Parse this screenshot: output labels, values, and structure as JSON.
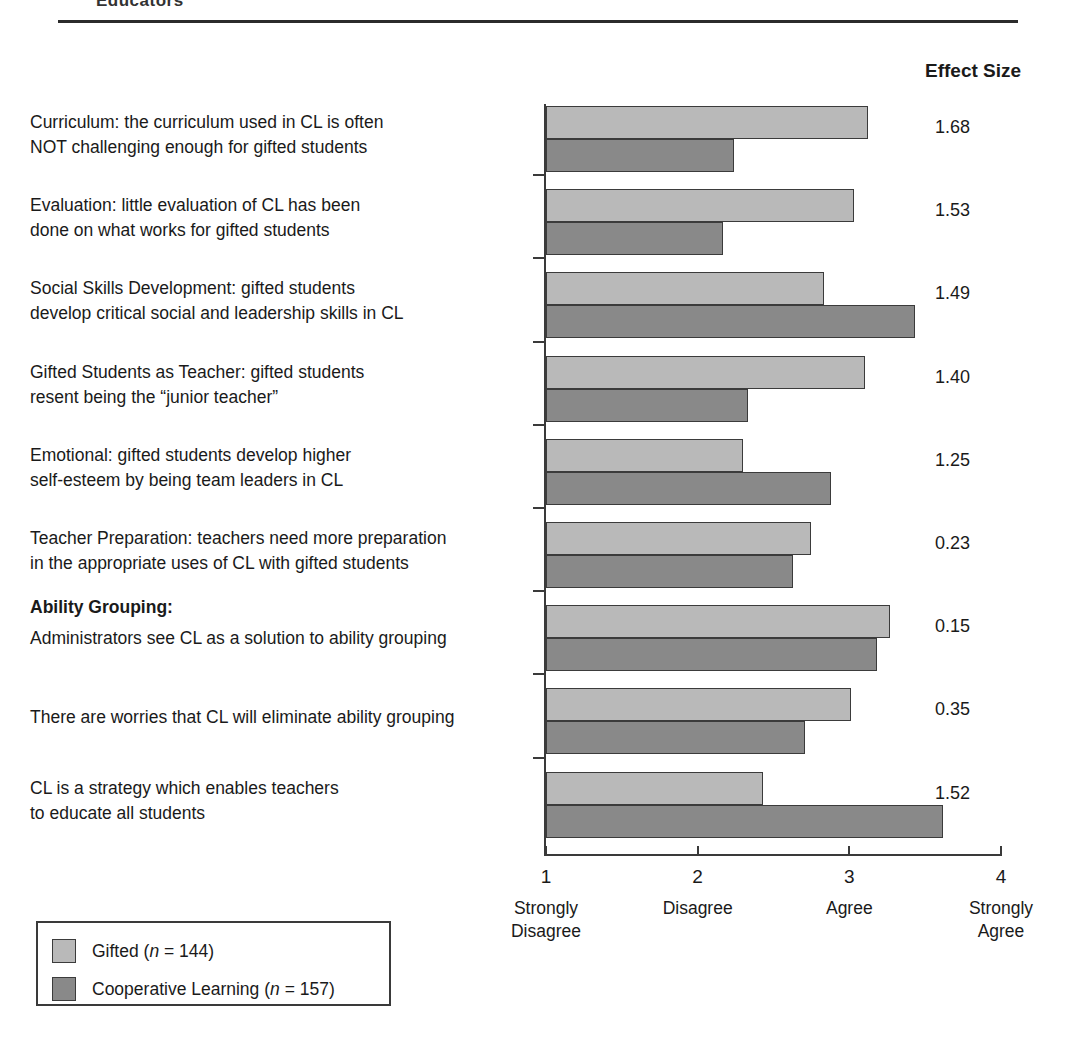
{
  "page": {
    "clipped_heading": "Educators",
    "effect_size_header": "Effect Size"
  },
  "legend": {
    "items": [
      {
        "label": "Gifted (n = 144)",
        "series": "Gifted",
        "n": "144",
        "color": "#b9b9b9"
      },
      {
        "label": "Cooperative Learning (n = 157)",
        "series": "Cooperative Learning",
        "n": "157",
        "color": "#898989"
      }
    ]
  },
  "axis": {
    "ticks": [
      {
        "num": "1",
        "caption": "Strongly\nDisagree"
      },
      {
        "num": "2",
        "caption": "Disagree"
      },
      {
        "num": "3",
        "caption": "Agree"
      },
      {
        "num": "4",
        "caption": "Strongly\nAgree"
      }
    ]
  },
  "rows": [
    {
      "label": "Curriculum: the curriculum used in CL is often\nNOT challenging enough for gifted students",
      "effect_size": "1.68"
    },
    {
      "label": "Evaluation: little evaluation of CL has been\ndone on what works for gifted students",
      "effect_size": "1.53"
    },
    {
      "label": "Social Skills Development: gifted students\ndevelop critical social and leadership skills in CL",
      "effect_size": "1.49"
    },
    {
      "label": "Gifted Students as Teacher: gifted students\nresent being the “junior teacher”",
      "effect_size": "1.40"
    },
    {
      "label": "Emotional: gifted students develop higher\nself-esteem by being team leaders in CL",
      "effect_size": "1.25"
    },
    {
      "label": "Teacher Preparation: teachers need more preparation\nin the appropriate uses of CL with gifted students",
      "effect_size": "0.23"
    },
    {
      "label": "Ability Grouping:",
      "sublabel": "Administrators see CL as a solution to ability grouping",
      "bold_head": true,
      "effect_size": "0.15"
    },
    {
      "label": "There are worries that CL will eliminate ability grouping",
      "effect_size": "0.35"
    },
    {
      "label": "CL is a strategy which enables teachers\nto educate all students",
      "effect_size": "1.52"
    }
  ],
  "chart_data": {
    "type": "bar",
    "title": "Effect Size",
    "orientation": "horizontal",
    "xlabel": "",
    "ylabel": "",
    "xlim": [
      1,
      4
    ],
    "xticks": [
      1,
      2,
      3,
      4
    ],
    "xticklabels": [
      "1\nStrongly Disagree",
      "2\nDisagree",
      "3\nAgree",
      "4\nStrongly Agree"
    ],
    "grid": false,
    "legend_position": "bottom-left",
    "categories": [
      "Curriculum: the curriculum used in CL is often NOT challenging enough for gifted students",
      "Evaluation: little evaluation of CL has been done on what works for gifted students",
      "Social Skills Development: gifted students develop critical social and leadership skills in CL",
      "Gifted Students as Teacher: gifted students resent being the “junior teacher”",
      "Emotional: gifted students develop higher self-esteem by being team leaders in CL",
      "Teacher Preparation: teachers need more preparation in the appropriate uses of CL with gifted students",
      "Ability Grouping: Administrators see CL as a solution to ability grouping",
      "There are worries that CL will eliminate ability grouping",
      "CL is a strategy which enables teachers to educate all students"
    ],
    "series": [
      {
        "name": "Gifted (n = 144)",
        "color": "#b9b9b9",
        "values": [
          3.12,
          3.03,
          2.83,
          3.1,
          2.3,
          2.75,
          3.27,
          3.01,
          2.43
        ]
      },
      {
        "name": "Cooperative Learning (n = 157)",
        "color": "#898989",
        "values": [
          2.24,
          2.17,
          3.43,
          2.33,
          2.88,
          2.63,
          3.18,
          2.71,
          3.62
        ]
      }
    ],
    "annotations": {
      "name": "Effect Size",
      "values": [
        "1.68",
        "1.53",
        "1.49",
        "1.40",
        "1.25",
        "0.23",
        "0.15",
        "0.35",
        "1.52"
      ]
    }
  }
}
